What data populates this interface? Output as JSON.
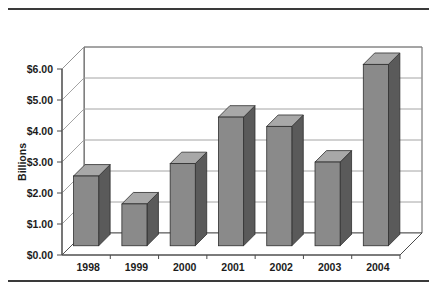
{
  "chart_data": {
    "type": "bar",
    "title": "",
    "subtitle": "",
    "xlabel": "",
    "ylabel": "Billions",
    "categories": [
      "1998",
      "1999",
      "2000",
      "2001",
      "2002",
      "2003",
      "2004"
    ],
    "values": [
      2.25,
      1.35,
      2.65,
      4.15,
      3.85,
      2.7,
      5.85
    ],
    "series": [
      {
        "name": "",
        "values": [
          2.25,
          1.35,
          2.65,
          4.15,
          3.85,
          2.7,
          5.85
        ]
      }
    ],
    "ylim": [
      0,
      6
    ],
    "ytick_values": [
      0,
      1,
      2,
      3,
      4,
      5,
      6
    ],
    "ytick_labels": [
      "$0.00",
      "$1.00",
      "$2.00",
      "$3.00",
      "$4.00",
      "$5.00",
      "$6.00"
    ],
    "xtick_labels": [
      "1998",
      "1999",
      "2000",
      "2001",
      "2002",
      "2003",
      "2004"
    ],
    "grid": "horizontal",
    "legend": "none",
    "style": "3d-columns",
    "annotations": []
  },
  "colors": {
    "bar_front": "#8a8a8a",
    "bar_side": "#5a5a5a",
    "bar_top": "#a8a8a8",
    "bar_outline": "#2e2e2e",
    "gridline": "#9a9a9a",
    "axis": "#4a4a4a",
    "wall": "#ffffff",
    "rule": "#3a3a3a",
    "text": "#1c1c1c"
  }
}
